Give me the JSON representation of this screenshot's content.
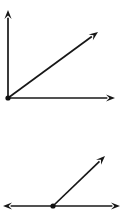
{
  "canvas": {
    "width": 124,
    "height": 215,
    "background_color": "#ffffff",
    "stroke_color": "#171717",
    "stroke_width": 1.7,
    "vertex_color": "#111111",
    "vertex_radius": 2.6
  },
  "figures": [
    {
      "id": "figure-top",
      "name": "right-angle-with-bisecting-ray",
      "description": "Right angle formed by a vertical ray and a horizontal ray sharing a common vertex, with a third diagonal ray between them",
      "vertex": {
        "x": 8,
        "y": 98
      },
      "angle_between_outer_rays_degrees": 90,
      "rays": [
        {
          "name": "vertical-ray",
          "from": {
            "x": 8,
            "y": 98
          },
          "to": {
            "x": 8,
            "y": 10
          },
          "direction_degrees": 90,
          "arrow": "end",
          "length": 88
        },
        {
          "name": "diagonal-ray",
          "from": {
            "x": 8,
            "y": 98
          },
          "to": {
            "x": 98,
            "y": 32
          },
          "direction_degrees": 36,
          "arrow": "end",
          "length": 112
        },
        {
          "name": "horizontal-ray",
          "from": {
            "x": 8,
            "y": 98
          },
          "to": {
            "x": 115,
            "y": 98
          },
          "direction_degrees": 0,
          "arrow": "end",
          "length": 107
        }
      ]
    },
    {
      "id": "figure-bottom",
      "name": "straight-line-with-ray",
      "description": "A horizontal straight line with arrowheads on both ends and a ray rising to the upper right from a point on the line",
      "vertex": {
        "x": 53,
        "y": 206
      },
      "angle_between_outer_rays_degrees": 180,
      "rays": [
        {
          "name": "horizontal-line-left-end",
          "from": {
            "x": 53,
            "y": 206
          },
          "to": {
            "x": 3,
            "y": 206
          },
          "direction_degrees": 180,
          "arrow": "end",
          "length": 50
        },
        {
          "name": "horizontal-line-right-end",
          "from": {
            "x": 53,
            "y": 206
          },
          "to": {
            "x": 120,
            "y": 206
          },
          "direction_degrees": 0,
          "arrow": "end",
          "length": 67
        },
        {
          "name": "diagonal-ray",
          "from": {
            "x": 53,
            "y": 206
          },
          "to": {
            "x": 105,
            "y": 156
          },
          "direction_degrees": 44,
          "arrow": "end",
          "length": 72
        }
      ]
    }
  ],
  "arrowhead": {
    "length": 9,
    "half_width": 3.6
  },
  "labels": []
}
